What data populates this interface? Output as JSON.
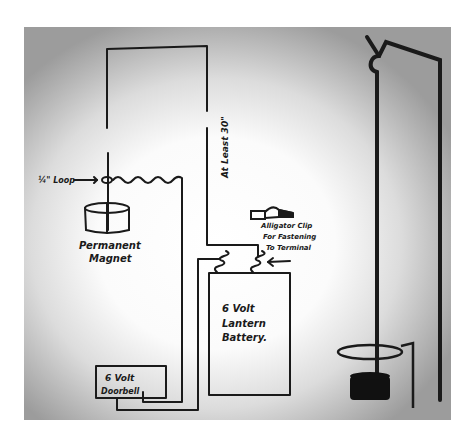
{
  "diagram": {
    "colors": {
      "ink": "#1a1a1a",
      "paper": "#ffffff",
      "vignette": "#9c9c9c"
    },
    "labels": {
      "loop": "¼\" Loop",
      "wire_length": "At Least 30\"",
      "magnet_line1": "Permanent",
      "magnet_line2": "Magnet",
      "clip_line1": "Alligator Clip",
      "clip_line2": "For Fastening",
      "clip_line3": "To Terminal",
      "battery_line1": "6 Volt",
      "battery_line2": "Lantern",
      "battery_line3": "Battery.",
      "doorbell_line1": "6 Volt",
      "doorbell_line2": "Doorbell"
    },
    "components": [
      {
        "name": "top-wire-loop"
      },
      {
        "name": "wire-loop-ring"
      },
      {
        "name": "coiled-wire"
      },
      {
        "name": "permanent-magnet"
      },
      {
        "name": "alligator-clip"
      },
      {
        "name": "lantern-battery"
      },
      {
        "name": "battery-terminals"
      },
      {
        "name": "doorbell"
      },
      {
        "name": "pendulum-stand"
      },
      {
        "name": "pendulum-ring"
      },
      {
        "name": "pendulum-weight"
      }
    ]
  }
}
